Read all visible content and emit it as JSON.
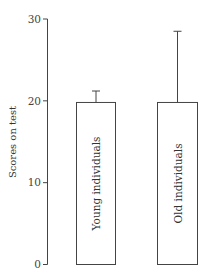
{
  "chart_data": {
    "type": "bar",
    "title": "",
    "xlabel": "",
    "ylabel": "Scores on test",
    "ylim": [
      0,
      30
    ],
    "yticks": [
      0,
      10,
      20,
      30
    ],
    "grid": false,
    "legend": null,
    "categories": [
      "Young individuals",
      "Old individuals"
    ],
    "values": [
      19.8,
      19.8
    ],
    "error_bars": [
      1.4,
      8.7
    ],
    "error_upper": [
      21.2,
      28.5
    ],
    "bar_labels_inside_rotated": true,
    "bar_fill": "#ffffff",
    "bar_stroke": "#444444"
  }
}
